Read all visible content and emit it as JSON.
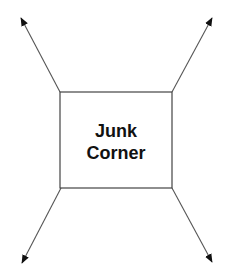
{
  "diagram": {
    "box": {
      "label_lines": [
        "Junk",
        "Corner"
      ],
      "x": 60,
      "y": 92,
      "width": 112,
      "height": 96,
      "stroke": "#444444"
    },
    "arrows": [
      {
        "name": "arrow-top-left",
        "from": [
          60,
          92
        ],
        "to": [
          21,
          18
        ]
      },
      {
        "name": "arrow-top-right",
        "from": [
          172,
          92
        ],
        "to": [
          212,
          18
        ]
      },
      {
        "name": "arrow-bottom-left",
        "from": [
          61,
          188
        ],
        "to": [
          22,
          263
        ]
      },
      {
        "name": "arrow-bottom-right",
        "from": [
          172,
          188
        ],
        "to": [
          212,
          262
        ]
      }
    ],
    "arrow_color": "#555555",
    "arrowhead_color": "#111111"
  }
}
